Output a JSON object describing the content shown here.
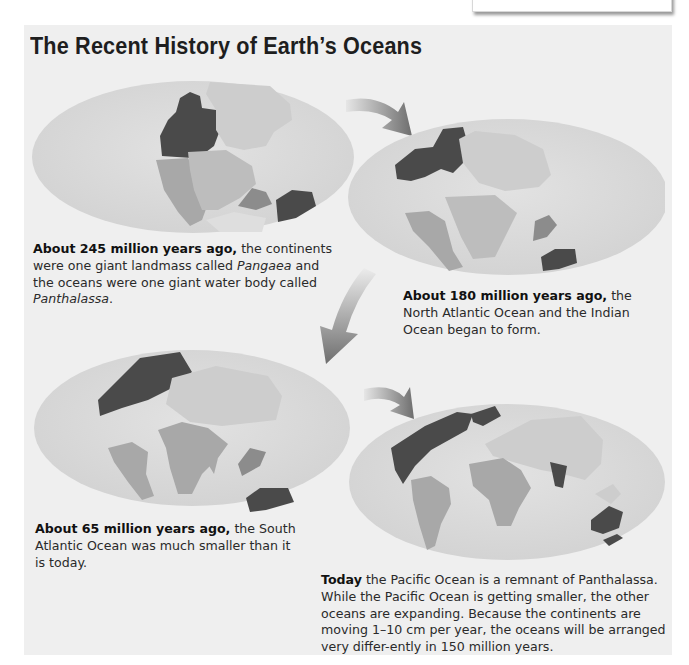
{
  "title": "The Recent History of Earth’s Oceans",
  "colors": {
    "panel_bg": "#efefef",
    "ocean": "#d9d9d9",
    "land_light": "#cdcdcd",
    "land_mid": "#a8a8a8",
    "land_dark": "#4a4a4a",
    "arrow": "#6e6e6e"
  },
  "stages": [
    {
      "id": "245mya",
      "map_label": "Pangaea map",
      "caption_bold": "About 245 million years ago,",
      "caption_parts": [
        " the continents were one giant landmass called ",
        "Pangaea",
        " and the oceans were one giant water body called ",
        "Panthalassa",
        "."
      ]
    },
    {
      "id": "180mya",
      "map_label": "180 million years ago map",
      "caption_bold": "About 180 million years ago,",
      "caption_text": " the North Atlantic Ocean and the Indian Ocean began to form."
    },
    {
      "id": "65mya",
      "map_label": "65 million years ago map",
      "caption_bold": "About 65 million years ago,",
      "caption_text": " the South Atlantic Ocean was much smaller than it is today."
    },
    {
      "id": "today",
      "map_label": "Present-day map",
      "caption_bold": "Today",
      "caption_text": " the Pacific Ocean is a remnant of Panthalassa. While the Pacific Ocean is getting smaller, the other oceans are expanding. Because the continents are moving 1–10 cm per year, the oceans will be arranged very differ-ently in 150 million years."
    }
  ],
  "arrows": [
    "arrow-1-to-2",
    "arrow-2-to-3",
    "arrow-3-to-4"
  ]
}
